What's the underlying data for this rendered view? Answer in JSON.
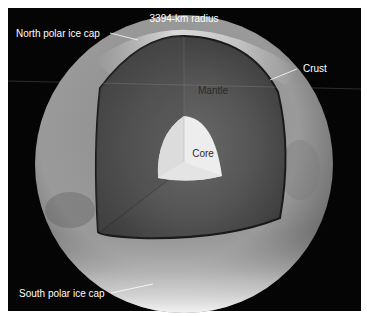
{
  "diagram": {
    "title": "3394-km radius",
    "labels": {
      "north_cap": "North polar ice cap",
      "crust": "Crust",
      "mantle": "Mantle",
      "core": "Core",
      "south_cap": "South polar ice cap"
    },
    "colors": {
      "background": "#050505",
      "frame": "#ffffff",
      "crust_light": "#b8b8b8",
      "crust_dark": "#6e6e6e",
      "mantle_light": "#5e5e5e",
      "mantle_dark": "#383838",
      "core_light": "#f2f2f2",
      "core_shade": "#d8d8d8",
      "ice_cap": "#f4f4f4",
      "label_text": "#ffffff",
      "inner_label_text": "#2a2a2a"
    }
  }
}
